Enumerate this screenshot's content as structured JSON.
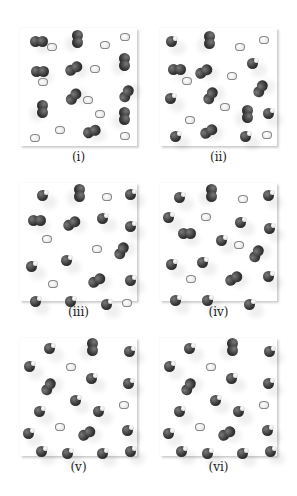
{
  "figure": {
    "panels": [
      {
        "id": "i",
        "label": "(i)",
        "x": 20,
        "y": 28,
        "molecules": [
          {
            "type": "O2",
            "x": 10,
            "y": 8,
            "r": 0
          },
          {
            "type": "O2",
            "x": 48,
            "y": 5,
            "r": 90
          },
          {
            "type": "H2",
            "x": 27,
            "y": 15
          },
          {
            "type": "H2",
            "x": 80,
            "y": 13
          },
          {
            "type": "H2",
            "x": 100,
            "y": 5
          },
          {
            "type": "O2",
            "x": 95,
            "y": 28,
            "r": 90
          },
          {
            "type": "O2",
            "x": 11,
            "y": 38,
            "r": 0
          },
          {
            "type": "O2",
            "x": 45,
            "y": 35,
            "r": -30
          },
          {
            "type": "H2",
            "x": 70,
            "y": 37
          },
          {
            "type": "H2",
            "x": 18,
            "y": 50
          },
          {
            "type": "O2",
            "x": 98,
            "y": 60,
            "r": -60
          },
          {
            "type": "O2",
            "x": 45,
            "y": 63,
            "r": -50
          },
          {
            "type": "H2",
            "x": 63,
            "y": 68
          },
          {
            "type": "O2",
            "x": 13,
            "y": 75,
            "r": 90
          },
          {
            "type": "H2",
            "x": 75,
            "y": 82
          },
          {
            "type": "O2",
            "x": 95,
            "y": 82,
            "r": 90
          },
          {
            "type": "H2",
            "x": 35,
            "y": 98
          },
          {
            "type": "H2",
            "x": 10,
            "y": 106
          },
          {
            "type": "O2",
            "x": 63,
            "y": 98,
            "r": -20
          },
          {
            "type": "H2",
            "x": 100,
            "y": 104
          }
        ]
      },
      {
        "id": "ii",
        "label": "(ii)",
        "x": 160,
        "y": 28,
        "molecules": [
          {
            "type": "H2O",
            "x": 6,
            "y": 8
          },
          {
            "type": "O2",
            "x": 40,
            "y": 6,
            "r": 90
          },
          {
            "type": "H2",
            "x": 75,
            "y": 15
          },
          {
            "type": "H2",
            "x": 99,
            "y": 8
          },
          {
            "type": "H2O",
            "x": 87,
            "y": 30
          },
          {
            "type": "O2",
            "x": 8,
            "y": 36,
            "r": 0
          },
          {
            "type": "O2",
            "x": 35,
            "y": 38,
            "r": -30
          },
          {
            "type": "H2",
            "x": 22,
            "y": 49
          },
          {
            "type": "H2",
            "x": 67,
            "y": 44
          },
          {
            "type": "O2",
            "x": 92,
            "y": 55,
            "r": -60
          },
          {
            "type": "H2O",
            "x": 5,
            "y": 65
          },
          {
            "type": "O2",
            "x": 42,
            "y": 62,
            "r": -60
          },
          {
            "type": "H2",
            "x": 60,
            "y": 75
          },
          {
            "type": "O2",
            "x": 78,
            "y": 80,
            "r": 90
          },
          {
            "type": "H2O",
            "x": 103,
            "y": 80
          },
          {
            "type": "H2",
            "x": 25,
            "y": 88
          },
          {
            "type": "H2O",
            "x": 10,
            "y": 103
          },
          {
            "type": "O2",
            "x": 40,
            "y": 98,
            "r": -30
          },
          {
            "type": "H2O",
            "x": 80,
            "y": 103
          },
          {
            "type": "H2",
            "x": 102,
            "y": 103
          }
        ]
      },
      {
        "id": "iii",
        "label": "(iii)",
        "x": 20,
        "y": 183,
        "molecules": [
          {
            "type": "H2O",
            "x": 17,
            "y": 7
          },
          {
            "type": "O2",
            "x": 50,
            "y": 4,
            "r": 90
          },
          {
            "type": "H2",
            "x": 82,
            "y": 10
          },
          {
            "type": "H2O",
            "x": 105,
            "y": 6
          },
          {
            "type": "O2",
            "x": 8,
            "y": 32,
            "r": 0
          },
          {
            "type": "O2",
            "x": 43,
            "y": 35,
            "r": -30
          },
          {
            "type": "H2O",
            "x": 77,
            "y": 30
          },
          {
            "type": "H2O",
            "x": 105,
            "y": 38
          },
          {
            "type": "H2",
            "x": 22,
            "y": 52
          },
          {
            "type": "H2",
            "x": 72,
            "y": 62
          },
          {
            "type": "O2",
            "x": 93,
            "y": 62,
            "r": -60
          },
          {
            "type": "H2O",
            "x": 6,
            "y": 78
          },
          {
            "type": "H2O",
            "x": 41,
            "y": 72
          },
          {
            "type": "H2",
            "x": 28,
            "y": 97
          },
          {
            "type": "O2",
            "x": 68,
            "y": 92,
            "r": -30
          },
          {
            "type": "H2O",
            "x": 105,
            "y": 92
          },
          {
            "type": "H2O",
            "x": 10,
            "y": 113
          },
          {
            "type": "H2O",
            "x": 45,
            "y": 113
          },
          {
            "type": "H2O",
            "x": 81,
            "y": 116
          },
          {
            "type": "H2",
            "x": 102,
            "y": 116
          }
        ]
      },
      {
        "id": "iv",
        "label": "(iv)",
        "x": 160,
        "y": 183,
        "molecules": [
          {
            "type": "H2O",
            "x": 14,
            "y": 9
          },
          {
            "type": "O2",
            "x": 42,
            "y": 4,
            "r": 90
          },
          {
            "type": "H2",
            "x": 78,
            "y": 12
          },
          {
            "type": "H2O",
            "x": 103,
            "y": 7
          },
          {
            "type": "H2O",
            "x": 3,
            "y": 29
          },
          {
            "type": "H2",
            "x": 41,
            "y": 30
          },
          {
            "type": "H2O",
            "x": 75,
            "y": 34
          },
          {
            "type": "H2O",
            "x": 104,
            "y": 40
          },
          {
            "type": "O2",
            "x": 18,
            "y": 45,
            "r": 0
          },
          {
            "type": "H2O",
            "x": 56,
            "y": 52
          },
          {
            "type": "H2",
            "x": 74,
            "y": 58
          },
          {
            "type": "O2",
            "x": 88,
            "y": 65,
            "r": -60
          },
          {
            "type": "H2O",
            "x": 6,
            "y": 76
          },
          {
            "type": "H2O",
            "x": 37,
            "y": 74
          },
          {
            "type": "H2",
            "x": 26,
            "y": 92
          },
          {
            "type": "O2",
            "x": 65,
            "y": 90,
            "r": -30
          },
          {
            "type": "H2O",
            "x": 103,
            "y": 88
          },
          {
            "type": "H2O",
            "x": 10,
            "y": 112
          },
          {
            "type": "H2O",
            "x": 42,
            "y": 112
          },
          {
            "type": "H2O",
            "x": 84,
            "y": 116
          }
        ]
      },
      {
        "id": "v",
        "label": "(v)",
        "x": 20,
        "y": 338,
        "molecules": [
          {
            "type": "H2O",
            "x": 24,
            "y": 5
          },
          {
            "type": "O2",
            "x": 63,
            "y": 3,
            "r": 90
          },
          {
            "type": "H2O",
            "x": 104,
            "y": 8
          },
          {
            "type": "H2O",
            "x": 4,
            "y": 23
          },
          {
            "type": "H2",
            "x": 46,
            "y": 25
          },
          {
            "type": "O2",
            "x": 20,
            "y": 43,
            "r": -60
          },
          {
            "type": "H2O",
            "x": 66,
            "y": 35
          },
          {
            "type": "H2O",
            "x": 103,
            "y": 40
          },
          {
            "type": "H2O",
            "x": 50,
            "y": 57
          },
          {
            "type": "H2O",
            "x": 14,
            "y": 68
          },
          {
            "type": "H2O",
            "x": 73,
            "y": 68
          },
          {
            "type": "H2",
            "x": 99,
            "y": 63
          },
          {
            "type": "H2O",
            "x": 3,
            "y": 90
          },
          {
            "type": "H2",
            "x": 35,
            "y": 85
          },
          {
            "type": "O2",
            "x": 58,
            "y": 90,
            "r": -30
          },
          {
            "type": "H2O",
            "x": 102,
            "y": 87
          },
          {
            "type": "H2O",
            "x": 16,
            "y": 108
          },
          {
            "type": "H2O",
            "x": 42,
            "y": 110
          },
          {
            "type": "H2O",
            "x": 77,
            "y": 110
          },
          {
            "type": "H2O",
            "x": 105,
            "y": 108
          }
        ]
      },
      {
        "id": "vi",
        "label": "(vi)",
        "x": 160,
        "y": 338,
        "molecules": [
          {
            "type": "H2O",
            "x": 24,
            "y": 5
          },
          {
            "type": "O2",
            "x": 63,
            "y": 3,
            "r": 90
          },
          {
            "type": "H2O",
            "x": 104,
            "y": 8
          },
          {
            "type": "H2O",
            "x": 4,
            "y": 23
          },
          {
            "type": "H2",
            "x": 46,
            "y": 25
          },
          {
            "type": "O2",
            "x": 20,
            "y": 43,
            "r": -60
          },
          {
            "type": "H2O",
            "x": 66,
            "y": 35
          },
          {
            "type": "H2O",
            "x": 103,
            "y": 40
          },
          {
            "type": "H2O",
            "x": 50,
            "y": 57
          },
          {
            "type": "H2O",
            "x": 14,
            "y": 68
          },
          {
            "type": "H2O",
            "x": 73,
            "y": 68
          },
          {
            "type": "H2",
            "x": 99,
            "y": 63
          },
          {
            "type": "H2O",
            "x": 3,
            "y": 90
          },
          {
            "type": "H2",
            "x": 35,
            "y": 85
          },
          {
            "type": "O2",
            "x": 58,
            "y": 90,
            "r": -30
          },
          {
            "type": "H2O",
            "x": 102,
            "y": 87
          },
          {
            "type": "H2O",
            "x": 16,
            "y": 108
          },
          {
            "type": "H2O",
            "x": 42,
            "y": 110
          },
          {
            "type": "H2O",
            "x": 77,
            "y": 110
          },
          {
            "type": "H2O",
            "x": 105,
            "y": 108
          }
        ]
      }
    ]
  }
}
